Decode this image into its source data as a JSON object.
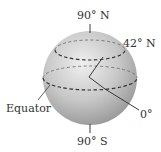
{
  "diagram": {
    "labels": {
      "north_pole": "90° N",
      "south_pole": "90° S",
      "latitude_line": "42° N",
      "equator": "Equator",
      "prime_meridian": "0°"
    },
    "colors": {
      "sphere_light": "#eeeeee",
      "sphere_dark": "#9a9a9a",
      "line": "#3a3a3a",
      "text": "#333333"
    }
  }
}
